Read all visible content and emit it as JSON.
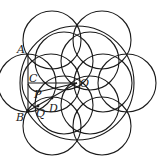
{
  "diagram": {
    "type": "geometry-figure",
    "stroke_color": "#1a1a1a",
    "background": "#ffffff",
    "center": {
      "name": "O",
      "x": 77,
      "y": 83
    },
    "big_circle": {
      "cx": 77,
      "cy": 83,
      "r": 57
    },
    "outer_circles": [
      {
        "cx": 52,
        "cy": 40,
        "r": 29
      },
      {
        "cx": 102,
        "cy": 40,
        "r": 29
      },
      {
        "cx": 127,
        "cy": 83,
        "r": 29
      },
      {
        "cx": 102,
        "cy": 126,
        "r": 29
      },
      {
        "cx": 52,
        "cy": 126,
        "r": 29
      },
      {
        "cx": 27,
        "cy": 83,
        "r": 29
      }
    ],
    "inner_circles": [
      {
        "cx": 64,
        "cy": 61,
        "r": 29
      },
      {
        "cx": 90,
        "cy": 61,
        "r": 29
      },
      {
        "cx": 103,
        "cy": 83,
        "r": 29
      },
      {
        "cx": 90,
        "cy": 105,
        "r": 29
      },
      {
        "cx": 64,
        "cy": 105,
        "r": 29
      },
      {
        "cx": 51,
        "cy": 83,
        "r": 29
      }
    ],
    "points": {
      "A": {
        "label": "A",
        "x": 28,
        "y": 54
      },
      "B": {
        "label": "B",
        "x": 28,
        "y": 111
      },
      "C": {
        "label": "C",
        "x": 28,
        "y": 83
      },
      "D": {
        "label": "D",
        "x": 52,
        "y": 98
      },
      "O": {
        "label": "O",
        "x": 77,
        "y": 83
      },
      "P": {
        "label": "P",
        "x": 38,
        "y": 92
      },
      "Q": {
        "label": "Q",
        "x": 38,
        "y": 106
      }
    },
    "labels": {
      "A": "A",
      "B": "B",
      "C": "C",
      "D": "D",
      "O": "O",
      "P": "P",
      "Q": "Q"
    }
  }
}
